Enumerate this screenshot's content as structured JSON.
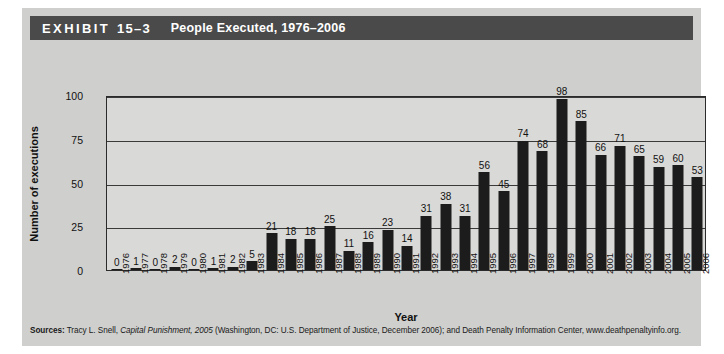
{
  "header": {
    "exhibit_label": "EXHIBIT",
    "exhibit_number": "15–3",
    "title": "People Executed, 1976–2006"
  },
  "colors": {
    "header_bar": "#4a4a4a",
    "card_background": "#cfcfcd",
    "plot_background": "#d9d9d7",
    "bar_fill": "#1c1c1c",
    "axis": "#2b2b2b"
  },
  "source": {
    "label": "Sources:",
    "part1": " Tracy L. Snell, ",
    "italic1": "Capital Punishment, 2005",
    "part2": " (Washington, DC: U.S. Department of Justice, December 2006); and Death Penalty Information Center, www.deathpenaltyinfo.org."
  },
  "chart_data": {
    "type": "bar",
    "title": "People Executed, 1976–2006",
    "xlabel": "Year",
    "ylabel": "Number of executions",
    "ylim": [
      0,
      100
    ],
    "yticks": [
      0,
      25,
      50,
      75,
      100
    ],
    "ytick_labels": [
      "0",
      "25",
      "50",
      "75",
      "100"
    ],
    "grid": true,
    "legend": "none",
    "show_value_labels": true,
    "categories": [
      "1976",
      "1977",
      "1978",
      "1979",
      "1980",
      "1981",
      "1982",
      "1983",
      "1984",
      "1985",
      "1986",
      "1987",
      "1988",
      "1989",
      "1990",
      "1991",
      "1992",
      "1993",
      "1994",
      "1995",
      "1996",
      "1997",
      "1998",
      "1999",
      "2000",
      "2001",
      "2002",
      "2003",
      "2004",
      "2005",
      "2006"
    ],
    "values": [
      0,
      1,
      0,
      2,
      0,
      1,
      2,
      5,
      21,
      18,
      18,
      25,
      11,
      16,
      23,
      14,
      31,
      38,
      31,
      56,
      45,
      74,
      68,
      98,
      85,
      66,
      71,
      65,
      59,
      60,
      53
    ]
  }
}
